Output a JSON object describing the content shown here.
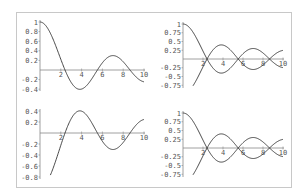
{
  "chart_data": [
    {
      "type": "line",
      "panel": "top-left",
      "title": "",
      "xlabel": "",
      "ylabel": "",
      "xlim": [
        0,
        10
      ],
      "ylim": [
        -0.4,
        1
      ],
      "x_ticks": [
        "2",
        "4",
        "6",
        "8",
        "10"
      ],
      "y_ticks": [
        "1",
        "0.8",
        "0.6",
        "0.4",
        "0.2",
        "-0.2",
        "-0.4"
      ],
      "series": [
        {
          "name": "f1",
          "x": [
            0,
            1,
            2,
            2.4,
            3,
            3.8,
            4,
            5,
            5.5,
            6,
            7,
            8,
            8.65,
            9,
            10
          ],
          "values": [
            1,
            0.77,
            0.22,
            0,
            -0.26,
            -0.4,
            -0.4,
            -0.18,
            0,
            0.15,
            0.3,
            0.17,
            0,
            -0.09,
            -0.25
          ]
        }
      ],
      "grid": false
    },
    {
      "type": "line",
      "panel": "top-right",
      "xlim": [
        0,
        10
      ],
      "ylim": [
        -0.75,
        1
      ],
      "x_ticks": [
        "2",
        "4",
        "6",
        "8",
        "10"
      ],
      "y_ticks": [
        "1",
        "0.75",
        "0.5",
        "0.25",
        "-0.25",
        "-0.5",
        "-0.75"
      ],
      "series": [
        {
          "name": "f1",
          "x": [
            0,
            1,
            2,
            2.4,
            3,
            3.8,
            5,
            5.5,
            7,
            8.65,
            10
          ],
          "values": [
            1,
            0.77,
            0.22,
            0,
            -0.26,
            -0.4,
            -0.18,
            0,
            0.3,
            0,
            -0.25
          ]
        },
        {
          "name": "f2",
          "x": [
            1,
            2,
            2.4,
            3,
            3.8,
            5,
            5.5,
            7,
            8.65,
            10
          ],
          "values": [
            -0.77,
            -0.22,
            0,
            0.26,
            0.4,
            0.18,
            0,
            -0.3,
            0,
            0.25
          ]
        }
      ],
      "grid": false
    },
    {
      "type": "line",
      "panel": "bottom-left",
      "xlim": [
        0,
        10
      ],
      "ylim": [
        -0.8,
        0.4
      ],
      "x_ticks": [
        "2",
        "4",
        "6",
        "8",
        "10"
      ],
      "y_ticks": [
        "0.4",
        "0.2",
        "-0.2",
        "-0.4",
        "-0.6",
        "-0.8"
      ],
      "series": [
        {
          "name": "f2",
          "x": [
            1,
            2,
            2.4,
            3,
            3.8,
            5,
            5.5,
            6,
            7,
            8,
            8.65,
            10
          ],
          "values": [
            -0.77,
            -0.22,
            0,
            0.26,
            0.4,
            0.18,
            0,
            -0.15,
            -0.3,
            -0.17,
            0,
            0.25
          ]
        }
      ],
      "grid": false
    },
    {
      "type": "line",
      "panel": "bottom-right",
      "xlim": [
        0,
        10
      ],
      "ylim": [
        -0.75,
        1
      ],
      "x_ticks": [
        "2",
        "4",
        "6",
        "8",
        "10"
      ],
      "y_ticks": [
        "1",
        "0.75",
        "0.5",
        "0.25",
        "-0.25",
        "-0.5",
        "-0.75"
      ],
      "series": [
        {
          "name": "f1",
          "x": [
            0,
            1,
            2,
            2.4,
            3,
            3.8,
            5,
            5.5,
            7,
            8.65,
            10
          ],
          "values": [
            1,
            0.77,
            0.22,
            0,
            -0.26,
            -0.4,
            -0.18,
            0,
            0.3,
            0,
            -0.25
          ]
        },
        {
          "name": "f2",
          "x": [
            1,
            2,
            2.4,
            3,
            3.8,
            5,
            5.5,
            7,
            8.65,
            10
          ],
          "values": [
            -0.77,
            -0.22,
            0,
            0.26,
            0.4,
            0.18,
            0,
            -0.3,
            0,
            0.25
          ]
        }
      ],
      "grid": false
    }
  ],
  "style": {
    "curve_color": "#333333",
    "axis_color": "#888888",
    "frame_color": "#c8c8c8"
  }
}
